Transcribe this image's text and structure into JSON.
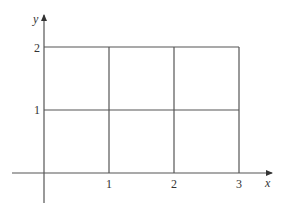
{
  "diagram": {
    "type": "coordinate-grid",
    "axes": {
      "x_label": "x",
      "y_label": "y",
      "color": "#555555"
    },
    "grid": {
      "x_range": [
        0,
        3
      ],
      "y_range": [
        0,
        2
      ],
      "cell_size": 1,
      "line_color": "#555555"
    },
    "x_ticks": [
      "1",
      "2",
      "3"
    ],
    "y_ticks": [
      "1",
      "2"
    ]
  }
}
